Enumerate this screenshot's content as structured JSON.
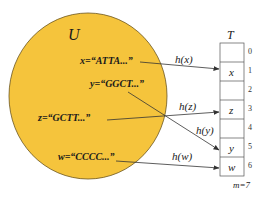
{
  "universe": {
    "label": "U",
    "fill_color": "#f5c43c",
    "stroke_color": "#6b5520"
  },
  "keys": [
    {
      "name": "x",
      "text": "x=“ATTA...”",
      "hash_label": "h(x)",
      "slot": 1
    },
    {
      "name": "y",
      "text": "y=“GGCT...”",
      "hash_label": "h(y)",
      "slot": 5
    },
    {
      "name": "z",
      "text": "z=“GCTT...”",
      "hash_label": "h(z)",
      "slot": 3
    },
    {
      "name": "w",
      "text": "w=“CCCC...”",
      "hash_label": "h(w)",
      "slot": 6
    }
  ],
  "table": {
    "label": "T",
    "size_label": "m=7",
    "slots": [
      {
        "index": "0",
        "content": ""
      },
      {
        "index": "1",
        "content": "x"
      },
      {
        "index": "2",
        "content": ""
      },
      {
        "index": "3",
        "content": "z"
      },
      {
        "index": "4",
        "content": ""
      },
      {
        "index": "5",
        "content": "y"
      },
      {
        "index": "6",
        "content": "w"
      }
    ]
  }
}
